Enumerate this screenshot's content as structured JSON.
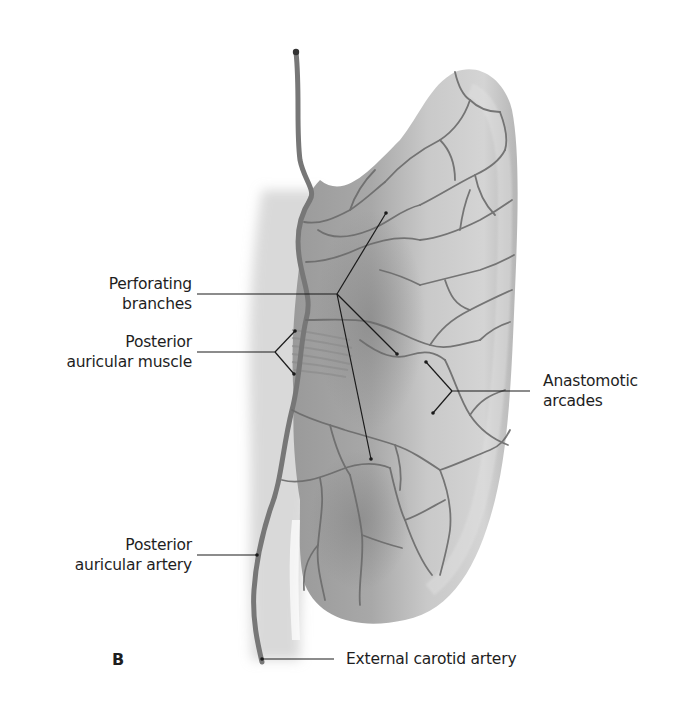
{
  "figure": {
    "panel_letter": "B",
    "colors": {
      "background": "#ffffff",
      "ear_fill": "#b8b8b8",
      "ear_highlight": "#d6d6d6",
      "ear_shadow": "#8e8e8e",
      "vessel": "#6e6e6e",
      "leader_line": "#1a1a1a",
      "text": "#1e1e1e"
    }
  },
  "labels": {
    "perforating_branches": {
      "line1": "Perforating",
      "line2": "branches"
    },
    "posterior_auricular_muscle": {
      "line1": "Posterior",
      "line2": "auricular muscle"
    },
    "anastomotic_arcades": {
      "line1": "Anastomotic",
      "line2": "arcades"
    },
    "posterior_auricular_artery": {
      "line1": "Posterior",
      "line2": "auricular artery"
    },
    "external_carotid_artery": {
      "line1": "External carotid artery"
    }
  }
}
